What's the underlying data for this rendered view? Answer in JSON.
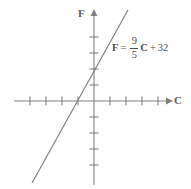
{
  "figure": {
    "width": 191,
    "height": 189,
    "background_color": "#ffffff",
    "stroke_color": "#808080",
    "text_color": "#4d4d4d",
    "axis_label_color": "#595959"
  },
  "axes": {
    "x_axis": {
      "label": "C",
      "label_name": "celsius",
      "arrow": "right-arrow",
      "start_px": 14,
      "end_px": 168,
      "y_px": 101,
      "tick_count_negative": 4,
      "tick_count_positive": 4,
      "tick_spacing_px": 16,
      "tick_length_px": 9
    },
    "y_axis": {
      "label": "F",
      "label_name": "fahrenheit",
      "arrow": "up-arrow",
      "start_px": 14,
      "end_px": 185,
      "x_px": 94,
      "tick_count_positive": 4,
      "tick_count_negative": 4,
      "tick_spacing_px": 16,
      "tick_length_px": 9
    },
    "origin_px": {
      "x": 94,
      "y": 101
    }
  },
  "equation": {
    "lhs": "F",
    "equals": "=",
    "numerator": "9",
    "denominator": "5",
    "variable": "C",
    "plus": "+",
    "constant": "32",
    "plain_text": "F = 9/5 C + 32"
  },
  "chart_data": {
    "type": "line",
    "title": "",
    "subtitle": "",
    "xlabel": "C",
    "ylabel": "F",
    "grid": false,
    "legend_position": "none",
    "annotations": [
      {
        "text": "F = 9/5 C + 32",
        "x_px": 112,
        "y_px": 36,
        "target": "line"
      }
    ],
    "axis_units": "tick marks unlabeled; one tick = 1 unit",
    "xlim": [
      -5,
      5
    ],
    "ylim": [
      -5.5,
      5.5
    ],
    "x_ticks": [
      -4,
      -3,
      -2,
      -1,
      1,
      2,
      3,
      4
    ],
    "y_ticks": [
      -4,
      -3,
      -2,
      -1,
      1,
      2,
      3,
      4
    ],
    "x_tick_labels": [
      "",
      "",
      "",
      "",
      "",
      "",
      "",
      ""
    ],
    "y_tick_labels": [
      "",
      "",
      "",
      "",
      "",
      "",
      "",
      ""
    ],
    "series": [
      {
        "name": "F = 9/5 C + 32",
        "slope": 1.8,
        "slope_fraction": "9/5",
        "intercept": 2.0,
        "intercept_note": "drawn y-intercept is about 2 tick units; formula constant is 32",
        "x": [
          -3.9,
          2.1
        ],
        "y": [
          -5.1,
          5.7
        ],
        "pixel_endpoints": [
          {
            "x": 32,
            "y": 183
          },
          {
            "x": 128,
            "y": 10
          }
        ],
        "x_axis_crossing_px": 78,
        "y_axis_crossing_px": 68,
        "color": "#808080"
      }
    ]
  }
}
